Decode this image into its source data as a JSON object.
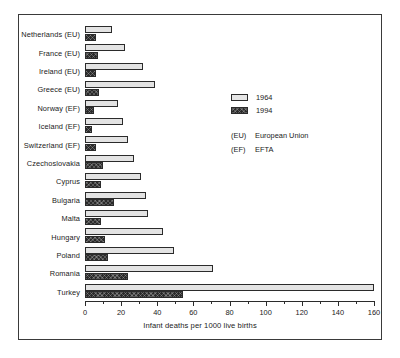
{
  "chart_data": {
    "type": "bar",
    "orientation": "horizontal",
    "title": "",
    "xlabel": "Infant deaths per 1000 live births",
    "ylabel": "",
    "xlim": [
      0,
      160
    ],
    "xticks": [
      0,
      20,
      40,
      60,
      80,
      100,
      120,
      140,
      160
    ],
    "xtick_labels": [
      "0",
      "20",
      "40",
      "60",
      "80",
      "100",
      "120",
      "140",
      "160"
    ],
    "minor_tick_interval": 10,
    "grid": false,
    "legend_position": "upper right",
    "categories": [
      "Netherlands (EU)",
      "France (EU)",
      "Ireland (EU)",
      "Greece (EU)",
      "Norway (EF)",
      "Iceland (EF)",
      "Switzerland (EF)",
      "Czechoslovakia",
      "Cyprus",
      "Bulgaria",
      "Malta",
      "Hungary",
      "Poland",
      "Romania",
      "Turkey"
    ],
    "series": [
      {
        "name": "1964",
        "values": [
          15,
          22,
          32,
          39,
          18,
          21,
          24,
          27,
          31,
          34,
          35,
          43,
          49,
          71,
          160
        ]
      },
      {
        "name": "1994",
        "values": [
          6,
          7,
          6,
          8,
          5,
          4,
          6,
          10,
          9,
          16,
          9,
          11,
          13,
          24,
          54
        ]
      }
    ],
    "annotations": [
      {
        "key": "(EU)",
        "text": "European Union"
      },
      {
        "key": "(EF)",
        "text": "EFTA"
      }
    ]
  },
  "legend": {
    "entries": [
      {
        "label": "1964"
      },
      {
        "label": "1994"
      }
    ]
  }
}
